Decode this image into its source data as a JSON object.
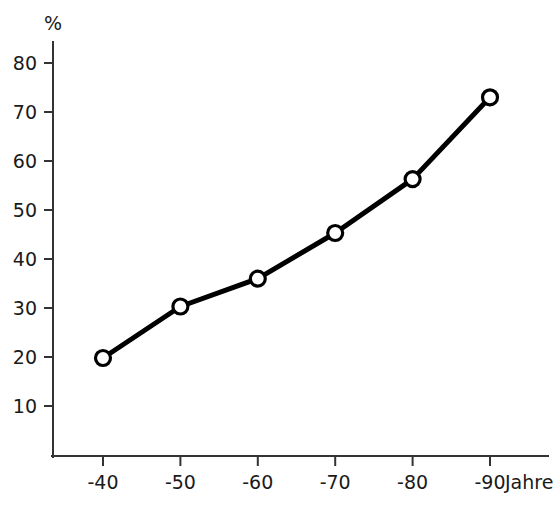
{
  "chart_data": {
    "type": "line",
    "title": "",
    "subtitle": "",
    "xlabel": "Jahre",
    "ylabel": "%",
    "categories": [
      "-40",
      "-50",
      "-60",
      "-70",
      "-80",
      "-90"
    ],
    "x": [
      40,
      50,
      60,
      70,
      80,
      90
    ],
    "values": [
      19.8,
      30.3,
      36.0,
      45.3,
      56.3,
      73.0
    ],
    "series": [
      {
        "name": "",
        "values": [
          19.8,
          30.3,
          36.0,
          45.3,
          56.3,
          73.0
        ]
      }
    ],
    "ylim": [
      0,
      85
    ],
    "xlim": [
      35,
      95
    ],
    "yticks": [
      10,
      20,
      30,
      40,
      50,
      60,
      70,
      80
    ],
    "ytick_labels": [
      "10",
      "20",
      "30",
      "40",
      "50",
      "60",
      "70",
      "80"
    ],
    "xticks": [
      40,
      50,
      60,
      70,
      80,
      90
    ],
    "xtick_labels": [
      "-40",
      "-50",
      "-60",
      "-70",
      "-80",
      "-90"
    ],
    "grid": false,
    "legend": false,
    "legend_position": "none",
    "marker": "open-circle",
    "line_color": "#000000",
    "marker_fill": "#ffffff",
    "marker_edge_color": "#000000",
    "axis_color": "#333333",
    "background_color": "#ffffff",
    "annotations": []
  },
  "labels": {
    "y_unit": "%",
    "x_unit": "Jahre"
  }
}
